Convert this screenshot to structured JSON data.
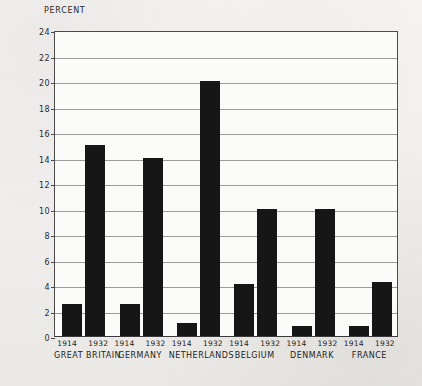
{
  "chart_data": {
    "type": "bar",
    "title": "PERCENT",
    "xlabel": "",
    "ylabel": "PERCENT",
    "ylim": [
      0,
      24
    ],
    "ytick_step": 2,
    "yticks": [
      0,
      2,
      4,
      6,
      8,
      10,
      12,
      14,
      16,
      18,
      20,
      22,
      24
    ],
    "grid": true,
    "legend": "none",
    "categories": [
      "GREAT BRITAIN",
      "GERMANY",
      "NETHERLANDS",
      "BELGIUM",
      "DENMARK",
      "FRANCE"
    ],
    "series": [
      {
        "name": "1914",
        "values": [
          2.5,
          2.5,
          1.0,
          4.1,
          0.8,
          0.8
        ]
      },
      {
        "name": "1932",
        "values": [
          15.0,
          14.0,
          20.0,
          10.0,
          10.0,
          4.2
        ]
      }
    ],
    "groups": [
      {
        "country": "GREAT BRITAIN",
        "bars": [
          {
            "year": "1914",
            "value": 2.5
          },
          {
            "year": "1932",
            "value": 15.0
          }
        ]
      },
      {
        "country": "GERMANY",
        "bars": [
          {
            "year": "1914",
            "value": 2.5
          },
          {
            "year": "1932",
            "value": 14.0
          }
        ]
      },
      {
        "country": "NETHERLANDS",
        "bars": [
          {
            "year": "1914",
            "value": 1.0
          },
          {
            "year": "1932",
            "value": 20.0
          }
        ]
      },
      {
        "country": "BELGIUM",
        "bars": [
          {
            "year": "1914",
            "value": 4.1
          },
          {
            "year": "1932",
            "value": 10.0
          }
        ]
      },
      {
        "country": "DENMARK",
        "bars": [
          {
            "year": "1914",
            "value": 0.8
          },
          {
            "year": "1932",
            "value": 10.0
          }
        ]
      },
      {
        "country": "FRANCE",
        "bars": [
          {
            "year": "1914",
            "value": 0.8
          },
          {
            "year": "1932",
            "value": 4.2
          }
        ]
      }
    ],
    "colors": {
      "bar": "#161616",
      "grid": "#9a9a99",
      "axis": "#4a4a4a",
      "plot_background": "#fbfbfa",
      "page_background": "#f2f1ef",
      "text": "#232323"
    }
  }
}
